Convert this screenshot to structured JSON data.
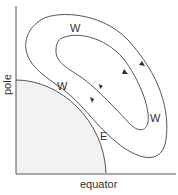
{
  "diagram": {
    "axes": {
      "x_label": "equator",
      "y_label": "pole"
    },
    "region_label": "E",
    "labels": {
      "outer_top": "W",
      "boundary": "W",
      "right": "W",
      "east": "E"
    },
    "colors": {
      "line": "#555555",
      "shade": "#f2f2f2",
      "text": "#333333"
    }
  }
}
